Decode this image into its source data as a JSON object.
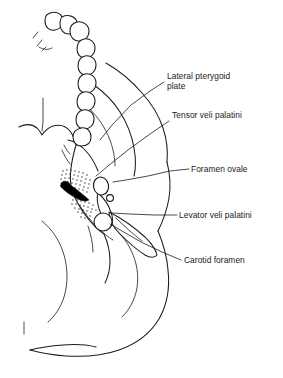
{
  "figure": {
    "type": "anatomical-line-drawing",
    "background_color": "#ffffff",
    "line_color": "#1c1c1c",
    "text_color": "#1a1a1a",
    "width": 283,
    "height": 378
  },
  "labels": [
    {
      "id": "lateral-pterygoid-plate",
      "line1": "Lateral pterygoid",
      "line2": "plate",
      "text_x": 167,
      "text_y": 79,
      "leader_points": "164,82 150,91 131,105 113,124 100,140"
    },
    {
      "id": "tensor-veli-palatini",
      "line1": "Tensor veli palatini",
      "line2": "",
      "text_x": 172,
      "text_y": 118,
      "leader_points": "169,121 150,134 128,150 108,166 96,176"
    },
    {
      "id": "foramen-ovale",
      "line1": "Foramen ovale",
      "line2": "",
      "text_x": 191,
      "text_y": 172,
      "leader_points": "189,169 170,171 148,176 126,180 113,182"
    },
    {
      "id": "levator-veli-palatini",
      "line1": "Levator veli palatini",
      "line2": "",
      "text_x": 179,
      "text_y": 218,
      "leader_points": "177,215 155,215 130,214 112,213"
    },
    {
      "id": "carotid-foramen",
      "line1": "Carotid foramen",
      "line2": "",
      "text_x": 184,
      "text_y": 263,
      "leader_points": "181,260 162,252 141,242 122,231 110,224"
    }
  ],
  "features": {
    "foramen_ovale_marker": "oval-outline",
    "carotid_foramen_marker": "circle-outline",
    "small_foramen_marker": "small-circle-outline",
    "muscle_attachment_texture": "stipple",
    "foramen_lacerum_fill": "solid-black",
    "dental_arch": "upper-teeth-row"
  }
}
